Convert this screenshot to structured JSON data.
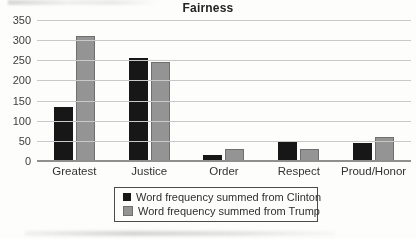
{
  "title": "Fairness",
  "colors": {
    "clinton": "#171717",
    "trump": "#949494",
    "gridline": "#c9c9c9",
    "axis_line": "#8f8f8f",
    "text": "#3a3a3a",
    "legend_border": "#4c4c4c"
  },
  "chart_data": {
    "type": "bar",
    "title": "Fairness",
    "categories": [
      "Greatest",
      "Justice",
      "Order",
      "Respect",
      "Proud/Honor"
    ],
    "series": [
      {
        "name": "Word frequency summed from Clinton",
        "color_key": "clinton",
        "values": [
          135,
          255,
          15,
          50,
          45
        ]
      },
      {
        "name": "Word frequency summed from Trump",
        "color_key": "trump",
        "values": [
          310,
          245,
          30,
          30,
          60
        ]
      }
    ],
    "xlabel": "",
    "ylabel": "",
    "ylim": [
      0,
      350
    ],
    "yticks": [
      350,
      300,
      250,
      200,
      150,
      100,
      50,
      0
    ],
    "grid": true,
    "legend_position": "bottom"
  }
}
